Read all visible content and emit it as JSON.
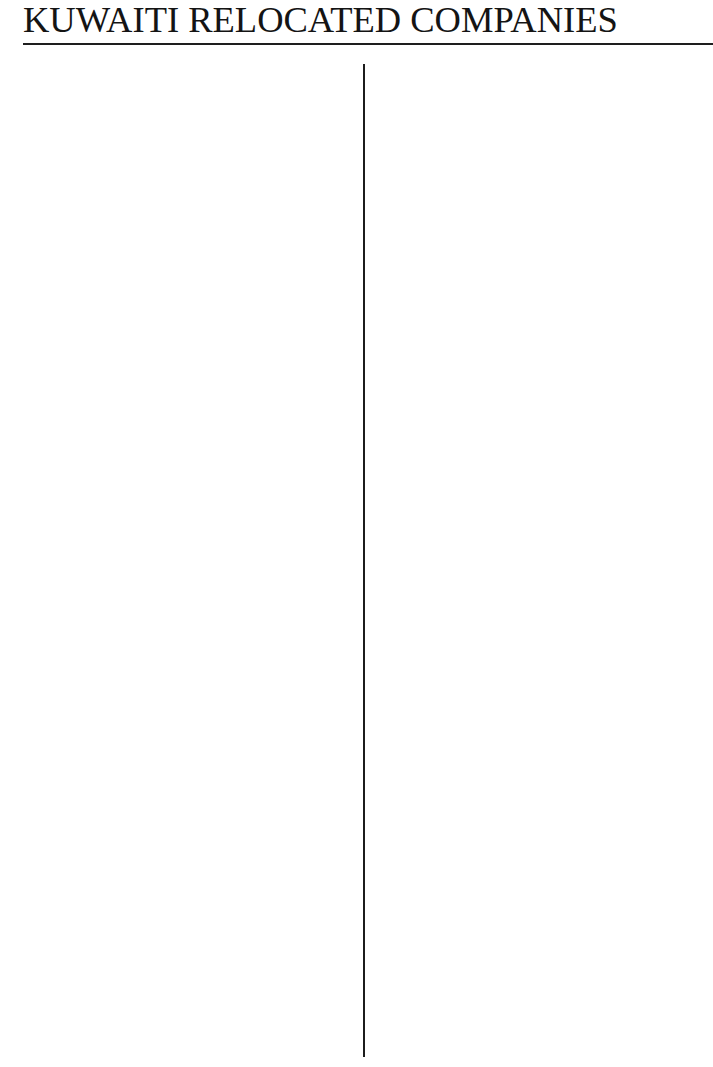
{
  "page": {
    "title": "KUWAITI RELOCATED COMPANIES"
  },
  "columns": {
    "left": {
      "entries": []
    },
    "right": {
      "entries": []
    }
  },
  "colors": {
    "text": "#141414",
    "rule": "#1e1e1e",
    "background": "#ffffff"
  }
}
